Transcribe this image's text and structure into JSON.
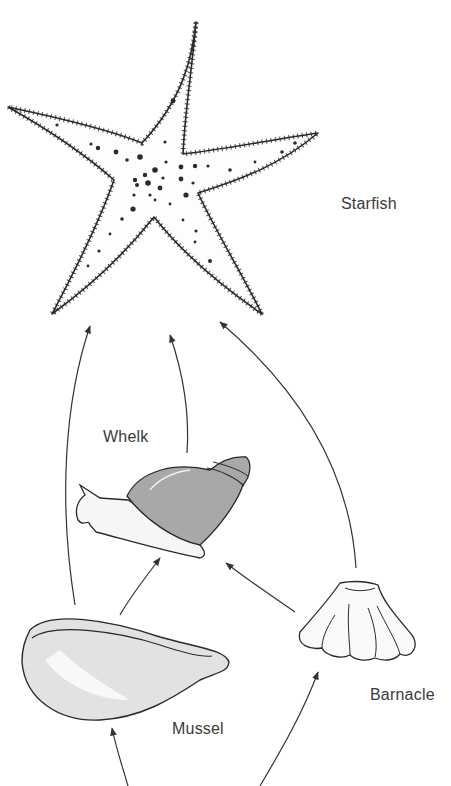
{
  "diagram": {
    "type": "food-web",
    "organisms": [
      {
        "id": "starfish",
        "label": "Starfish",
        "role": "top predator"
      },
      {
        "id": "whelk",
        "label": "Whelk",
        "role": "predator"
      },
      {
        "id": "mussel",
        "label": "Mussel",
        "role": "prey"
      },
      {
        "id": "barnacle",
        "label": "Barnacle",
        "role": "prey"
      }
    ],
    "edges": [
      {
        "from": "mussel",
        "to": "starfish"
      },
      {
        "from": "whelk",
        "to": "starfish"
      },
      {
        "from": "barnacle",
        "to": "starfish"
      },
      {
        "from": "mussel",
        "to": "whelk"
      },
      {
        "from": "barnacle",
        "to": "whelk"
      },
      {
        "from": "source",
        "to": "mussel"
      },
      {
        "from": "source",
        "to": "barnacle"
      }
    ],
    "colors": {
      "line": "#333333",
      "whelk_shell": "#a8a8a8",
      "mussel_shell": "#e2e2e2",
      "outline": "#2a2a2a"
    }
  }
}
